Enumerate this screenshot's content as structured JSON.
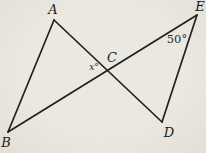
{
  "figure": {
    "background_color": "#e9e6df",
    "line_color": "#23211e",
    "label_color": "#1d1b18",
    "vertex_labels": {
      "A": "A",
      "B": "B",
      "C": "C",
      "D": "D",
      "E": "E"
    },
    "angle_labels": {
      "at_C": "x°",
      "at_E": "50°"
    }
  }
}
